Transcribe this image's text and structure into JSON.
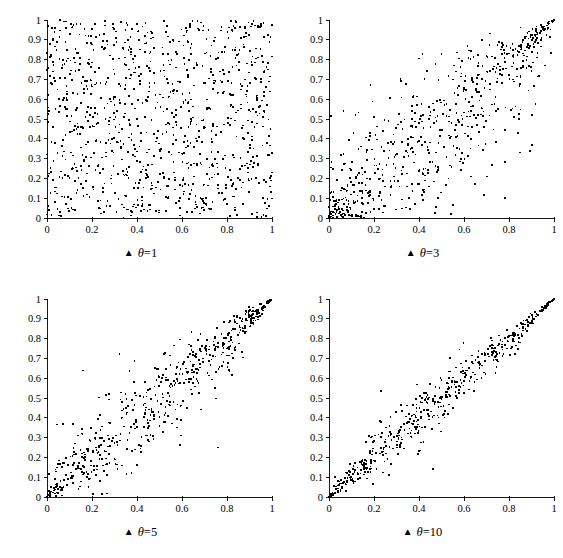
{
  "figure": {
    "background_color": "#ffffff",
    "foreground_color": "#000000",
    "layout": "2x2 grid of scatter plots",
    "marker_glyph": "▲",
    "panel_count": 4
  },
  "chart_data": [
    {
      "type": "scatter",
      "title": "θ = 1",
      "caption_marker": "▲",
      "caption_symbol": "θ",
      "caption_equals": "=",
      "caption_value": "1",
      "theta": 1,
      "n_points": 1000,
      "xlabel": "",
      "ylabel": "",
      "xlim": [
        0,
        1
      ],
      "ylim": [
        0,
        1
      ],
      "xticks": [
        "0",
        "0.2",
        "0.4",
        "0.6",
        "0.8",
        "1"
      ],
      "xtick_values": [
        0,
        0.2,
        0.4,
        0.6,
        0.8,
        1
      ],
      "yticks": [
        "0",
        "0.1",
        "0.2",
        "0.3",
        "0.4",
        "0.5",
        "0.6",
        "0.7",
        "0.8",
        "0.9",
        "1"
      ],
      "ytick_values": [
        0,
        0.1,
        0.2,
        0.3,
        0.4,
        0.5,
        0.6,
        0.7,
        0.8,
        0.9,
        1
      ],
      "grid": false,
      "legend": "none",
      "description": "Gumbel copula sample, independence case; points fill the unit square uniformly"
    },
    {
      "type": "scatter",
      "title": "θ = 3",
      "caption_marker": "▲",
      "caption_symbol": "θ",
      "caption_equals": "=",
      "caption_value": "3",
      "theta": 3,
      "n_points": 1000,
      "xlabel": "",
      "ylabel": "",
      "xlim": [
        0,
        1
      ],
      "ylim": [
        0,
        1
      ],
      "xticks": [
        "0",
        "0.2",
        "0.4",
        "0.6",
        "0.8",
        "1"
      ],
      "xtick_values": [
        0,
        0.2,
        0.4,
        0.6,
        0.8,
        1
      ],
      "yticks": [
        "0",
        "0.1",
        "0.2",
        "0.3",
        "0.4",
        "0.5",
        "0.6",
        "0.7",
        "0.8",
        "0.9",
        "1"
      ],
      "ytick_values": [
        0,
        0.1,
        0.2,
        0.3,
        0.4,
        0.5,
        0.6,
        0.7,
        0.8,
        0.9,
        1
      ],
      "grid": false,
      "legend": "none",
      "description": "Gumbel copula sample with moderate positive dependence; points concentrate near the diagonal at low values"
    },
    {
      "type": "scatter",
      "title": "θ = 5",
      "caption_marker": "▲",
      "caption_symbol": "θ",
      "caption_equals": "=",
      "caption_value": "5",
      "theta": 5,
      "n_points": 1000,
      "xlabel": "",
      "ylabel": "",
      "xlim": [
        0,
        1
      ],
      "ylim": [
        0,
        1
      ],
      "xticks": [
        "0",
        "0.2",
        "0.4",
        "0.6",
        "0.8",
        "1"
      ],
      "xtick_values": [
        0,
        0.2,
        0.4,
        0.6,
        0.8,
        1
      ],
      "yticks": [
        "0",
        "0.1",
        "0.2",
        "0.3",
        "0.4",
        "0.5",
        "0.6",
        "0.7",
        "0.8",
        "0.9",
        "1"
      ],
      "ytick_values": [
        0,
        0.1,
        0.2,
        0.3,
        0.4,
        0.5,
        0.6,
        0.7,
        0.8,
        0.9,
        1
      ],
      "grid": false,
      "legend": "none",
      "description": "Gumbel copula sample with strong positive dependence; tight band along the diagonal"
    },
    {
      "type": "scatter",
      "title": "θ = 10",
      "caption_marker": "▲",
      "caption_symbol": "θ",
      "caption_equals": "=",
      "caption_value": "10",
      "theta": 10,
      "n_points": 1000,
      "xlabel": "",
      "ylabel": "",
      "xlim": [
        0,
        1
      ],
      "ylim": [
        0,
        1
      ],
      "xticks": [
        "0",
        "0.2",
        "0.4",
        "0.6",
        "0.8",
        "1"
      ],
      "xtick_values": [
        0,
        0.2,
        0.4,
        0.6,
        0.8,
        1
      ],
      "yticks": [
        "0",
        "0.1",
        "0.2",
        "0.3",
        "0.4",
        "0.5",
        "0.6",
        "0.7",
        "0.8",
        "0.9",
        "1"
      ],
      "ytick_values": [
        0,
        0.1,
        0.2,
        0.3,
        0.4,
        0.5,
        0.6,
        0.7,
        0.8,
        0.9,
        1
      ],
      "grid": false,
      "legend": "none",
      "description": "Gumbel copula sample with very strong dependence; points hug the diagonal closely"
    }
  ]
}
